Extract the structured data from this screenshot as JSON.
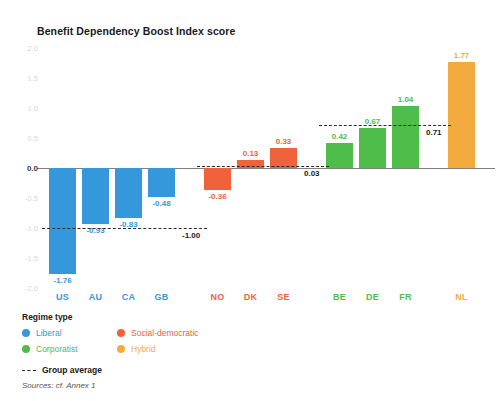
{
  "chart_data": {
    "type": "bar",
    "title": "Benefit Dependency Boost Index score",
    "xlabel": "",
    "ylabel": "",
    "ylim": [
      -2.0,
      2.0
    ],
    "yticks": [
      "2.0",
      "1.5",
      "1.0",
      "0.5",
      "0.0",
      "-0.5",
      "-1.0",
      "-1.5",
      "-2.0"
    ],
    "grid": false,
    "legend_position": "below-left",
    "categories": [
      "US",
      "AU",
      "CA",
      "GB",
      "NO",
      "DK",
      "SE",
      "BE",
      "DE",
      "FR",
      "NL"
    ],
    "values": [
      -1.76,
      -0.93,
      -0.83,
      -0.48,
      -0.36,
      0.13,
      0.33,
      0.42,
      0.67,
      1.04,
      1.77
    ],
    "bar_labels": [
      "-1.76",
      "-0.93",
      "-0.83",
      "-0.48",
      "-0.36",
      "0.13",
      "0.33",
      "0.42",
      "0.67",
      "1.04",
      "1.77"
    ],
    "groups": [
      {
        "name": "Liberal",
        "color": "#3498db",
        "members": [
          "US",
          "AU",
          "CA",
          "GB"
        ],
        "average": -1.0,
        "average_label": "-1.00"
      },
      {
        "name": "Social-democratic",
        "color": "#f0623c",
        "members": [
          "NO",
          "DK",
          "SE"
        ],
        "average": 0.03,
        "average_label": "0.03"
      },
      {
        "name": "Corporatist",
        "color": "#4fbd4a",
        "members": [
          "BE",
          "DE",
          "FR"
        ],
        "average": 0.71,
        "average_label": "0.71"
      },
      {
        "name": "Hybrid",
        "color": "#f2ab3c",
        "members": [
          "NL"
        ],
        "average": null,
        "average_label": ""
      }
    ],
    "annotations": [
      "Group average"
    ]
  },
  "header": {
    "title": "Benefit Dependency Boost Index score"
  },
  "axis": {
    "y": {
      "ticks": [
        {
          "label": "2.0",
          "value": 2.0
        },
        {
          "label": "1.5",
          "value": 1.5
        },
        {
          "label": "1.0",
          "value": 1.0
        },
        {
          "label": "0.5",
          "value": 0.5
        },
        {
          "label": "0.0",
          "value": 0.0
        },
        {
          "label": "-0.5",
          "value": -0.5
        },
        {
          "label": "-1.0",
          "value": -1.0
        },
        {
          "label": "-1.5",
          "value": -1.5
        },
        {
          "label": "-2.0",
          "value": -2.0
        }
      ]
    }
  },
  "legend": {
    "title": "Regime type",
    "items": [
      {
        "label": "Liberal",
        "color": "#3498db"
      },
      {
        "label": "Social-democratic",
        "color": "#f0623c"
      },
      {
        "label": "Corporatist",
        "color": "#4fbd4a"
      },
      {
        "label": "Hybrid",
        "color": "#f2ab3c"
      }
    ],
    "average_label": "Group average"
  },
  "footer": {
    "source": "Sources: cf. Annex 1"
  }
}
